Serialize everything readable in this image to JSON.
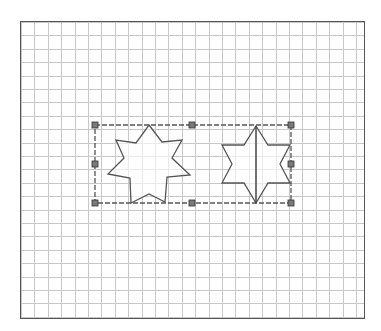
{
  "canvas": {
    "grid_pitch_px": 13.4,
    "grid_color": "#c8c8c8",
    "border_color": "#555555",
    "background": "#ffffff"
  },
  "selection": {
    "rect": {
      "x": 95,
      "y": 125,
      "width": 196,
      "height": 78
    },
    "border_color": "#555555",
    "handle_color": "#7a7a7a",
    "handles": [
      {
        "id": "nw",
        "x": 95,
        "y": 125
      },
      {
        "id": "n",
        "x": 192,
        "y": 125
      },
      {
        "id": "ne",
        "x": 291,
        "y": 125
      },
      {
        "id": "w",
        "x": 95,
        "y": 164
      },
      {
        "id": "e",
        "x": 291,
        "y": 164
      },
      {
        "id": "sw",
        "x": 95,
        "y": 203
      },
      {
        "id": "s",
        "x": 192,
        "y": 203
      },
      {
        "id": "se",
        "x": 291,
        "y": 203
      }
    ]
  },
  "shapes": [
    {
      "name": "seven-point-star",
      "points": 7,
      "stroke": "#555555"
    },
    {
      "name": "six-point-star-split",
      "points": 6,
      "stroke": "#555555",
      "has_divider": true
    }
  ]
}
